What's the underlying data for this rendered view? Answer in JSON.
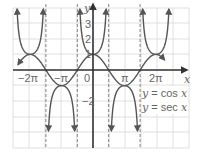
{
  "chart_data": {
    "type": "line",
    "title": "",
    "xlabel": "x",
    "ylabel": "y",
    "xlim": [
      -6.0,
      5.0
    ],
    "ylim": [
      -4.0,
      4.0
    ],
    "grid": true,
    "x_tick_labels": [
      "-2π",
      "-π",
      "0",
      "π",
      "2π"
    ],
    "x_tick_values": [
      -6.2832,
      -3.1416,
      0,
      3.1416,
      6.2832
    ],
    "y_tick_labels": [
      "-2",
      "1",
      "2",
      "3"
    ],
    "y_tick_values": [
      -2,
      1,
      2,
      3
    ],
    "asymptotes_x": [
      -4.7124,
      -1.5708,
      1.5708,
      4.7124
    ],
    "asymptote_labels": [
      "-3π/2",
      "-π/2",
      "π/2",
      "3π/2"
    ],
    "series": [
      {
        "name": "y = cos x",
        "function": "cos",
        "x_range": [
          -7.1,
          7.0
        ],
        "color": "#555555"
      },
      {
        "name": "y = sec x",
        "function": "sec",
        "color": "#555555"
      }
    ],
    "legend": [
      "y = cos x",
      "y = sec x"
    ],
    "legend_position": "right, below x-axis"
  },
  "labels": {
    "x_axis": "x",
    "y_axis": "y",
    "origin": "0",
    "neg_two_pi": "−2π",
    "neg_pi": "−π",
    "pi": "π",
    "two_pi": "2π",
    "y1": "1",
    "y2": "2",
    "y3": "3",
    "yneg2": "−2",
    "legend_cos": "y = cos x",
    "legend_sec": "y = sec x"
  },
  "colors": {
    "curve": "#555555",
    "axis": "#333333",
    "grid": "#d8d8d8",
    "asymptote": "#777777",
    "label": "#666666"
  }
}
